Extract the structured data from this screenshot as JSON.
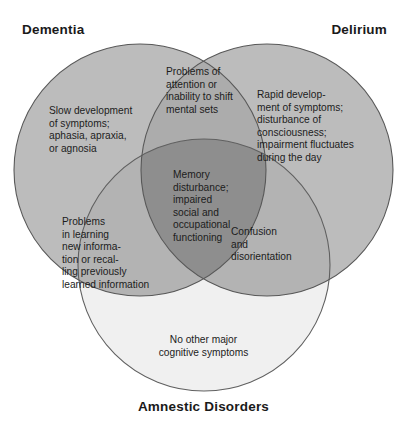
{
  "figure": {
    "type": "venn-diagram",
    "set_count": 3,
    "width": 407,
    "height": 422,
    "background_color": "#ffffff"
  },
  "labels": {
    "dementia": "Dementia",
    "delirium": "Delirium",
    "amnestic": "Amnestic Disorders"
  },
  "regions": {
    "dementia_only": "Slow development\nof symptoms;\naphasia, apraxia,\nor agnosia",
    "delirium_only": "Rapid develop-\nment of symptoms;\ndisturbance of\nconsciousness;\nimpairment fluctuates\nduring the day",
    "dementia_delirium": "Problems of\nattention or\ninability to shift\nmental sets",
    "center_all_three": "Memory\ndisturbance;\nimpaired\nsocial and\noccupational\nfunctioning",
    "dementia_amnestic": "Problems\nin learning\nnew informa-\ntion or recal-\nling previously\nlearned information",
    "delirium_amnestic": "Confusion\nand\ndisorientation",
    "amnestic_only": "No other major\ncognitive symptoms"
  },
  "colors": {
    "circle_stroke": "#5e5e5e",
    "single_overlap_gray": "#bbbbbb",
    "light_circle_gray": "#f0f0f0",
    "double_overlap_gray": "#aaaaaa",
    "triple_overlap_gray": "#8e8e8e",
    "text_color": "#1c1c1c",
    "heading_color": "#1a1a1a"
  },
  "geometry": {
    "dementia_circle": {
      "cx": 140,
      "cy": 170,
      "r": 126
    },
    "delirium_circle": {
      "cx": 267,
      "cy": 170,
      "r": 126
    },
    "amnestic_circle": {
      "cx": 204,
      "cy": 265,
      "r": 126
    }
  }
}
